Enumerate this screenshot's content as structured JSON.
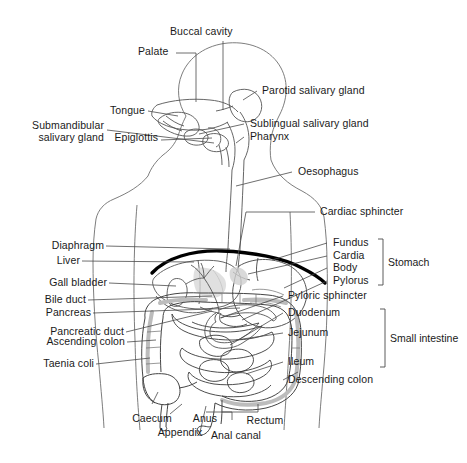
{
  "figure": {
    "background_color": "#ffffff",
    "line_color": "#3a3a3a",
    "accent_color": "#000000",
    "shade_color": "#c9c9c9",
    "text_color": "#1a1a1a"
  },
  "labels": {
    "buccal_cavity": "Buccal cavity",
    "palate": "Palate",
    "tongue": "Tongue",
    "submandibular_salivary_gland_line1": "Submandibular",
    "submandibular_salivary_gland_line2": "salivary gland",
    "epiglottis": "Epiglottis",
    "parotid_salivary_gland": "Parotid salivary gland",
    "sublingual_salivary_gland": "Sublingual salivary gland",
    "pharynx": "Pharynx",
    "oesophagus": "Oesophagus",
    "cardiac_sphincter": "Cardiac sphincter",
    "diaphragm": "Diaphragm",
    "liver": "Liver",
    "gall_bladder": "Gall bladder",
    "bile_duct": "Bile duct",
    "pancreas": "Pancreas",
    "pancreatic_duct": "Pancreatic duct",
    "ascending_colon": "Ascending colon",
    "taenia_coli": "Taenia coli",
    "fundus": "Fundus",
    "cardia": "Cardia",
    "body": "Body",
    "pylorus": "Pylorus",
    "stomach": "Stomach",
    "pyloric_sphincter": "Pyloric sphincter",
    "duodenum": "Duodenum",
    "jejunum": "Jejunum",
    "ileum": "Ileum",
    "small_intestine": "Small intestine",
    "descending_colon": "Descending colon",
    "caecum": "Caecum",
    "appendix": "Appendix",
    "anus": "Anus",
    "anal_canal": "Anal canal",
    "rectum": "Rectum"
  }
}
